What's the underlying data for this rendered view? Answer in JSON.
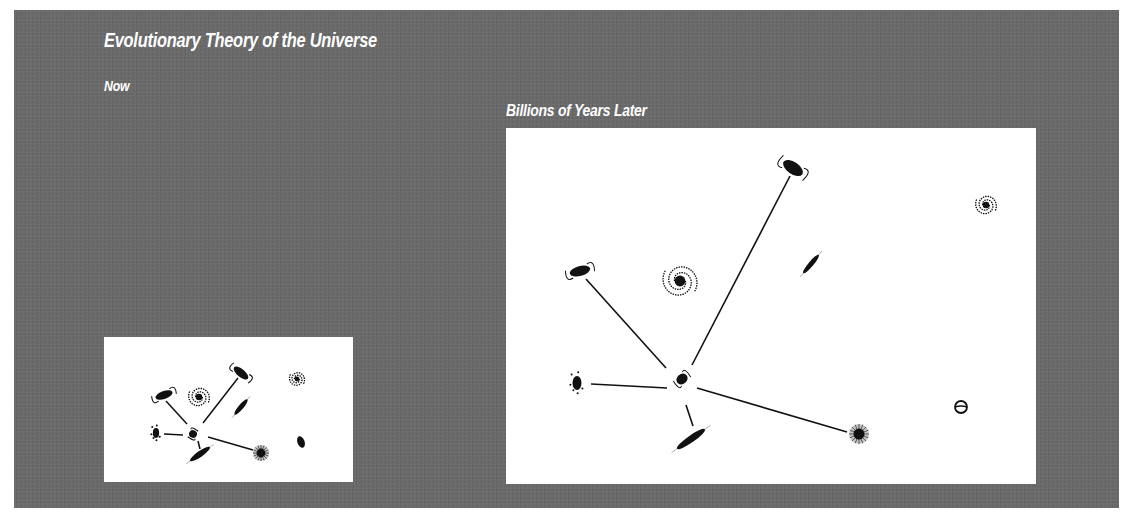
{
  "figure": {
    "title": "Evolutionary Theory of the Universe",
    "colors": {
      "background": "#6b6b6b",
      "panel": "#ffffff",
      "ink": "#111111",
      "text": "#ffffff"
    }
  },
  "panels": [
    {
      "id": "now",
      "label": "Now",
      "size": [
        249,
        145
      ],
      "center": [
        88,
        94
      ],
      "galaxies": [
        {
          "name": "elongated-spiral-top-left",
          "type": "barred",
          "x": 60,
          "y": 58,
          "rx": 12,
          "ry": 4,
          "rot": -20
        },
        {
          "name": "spiral-upper",
          "type": "spiral",
          "x": 95,
          "y": 60,
          "r": 11
        },
        {
          "name": "elongated-spiral-top",
          "type": "barred",
          "x": 137,
          "y": 36,
          "rx": 12,
          "ry": 4,
          "rot": 40
        },
        {
          "name": "spiral-top-right",
          "type": "spiral",
          "x": 193,
          "y": 42,
          "r": 8
        },
        {
          "name": "edge-on-middle",
          "type": "edgeon",
          "x": 137,
          "y": 70,
          "rx": 10,
          "ry": 2.5,
          "rot": -50
        },
        {
          "name": "irregular-left",
          "type": "irregular",
          "x": 52,
          "y": 96,
          "r": 7
        },
        {
          "name": "central-galaxy",
          "type": "barred",
          "x": 89,
          "y": 97,
          "rx": 5,
          "ry": 4,
          "rot": -60
        },
        {
          "name": "edge-on-bottom",
          "type": "edgeon",
          "x": 96,
          "y": 117,
          "rx": 12,
          "ry": 3,
          "rot": -35
        },
        {
          "name": "elliptical-bottom",
          "type": "elliptical",
          "x": 157,
          "y": 116,
          "r": 8
        },
        {
          "name": "irregular-right",
          "type": "compact",
          "x": 197,
          "y": 105,
          "r": 6
        }
      ],
      "lines": [
        {
          "from": [
            62,
            64
          ],
          "to": [
            83,
            87
          ]
        },
        {
          "from": [
            134,
            41
          ],
          "to": [
            99,
            86
          ]
        },
        {
          "from": [
            60,
            97
          ],
          "to": [
            79,
            98
          ]
        },
        {
          "from": [
            94,
            104
          ],
          "to": [
            96,
            112
          ]
        },
        {
          "from": [
            104,
            100
          ],
          "to": [
            149,
            113
          ]
        }
      ]
    },
    {
      "id": "later",
      "label": "Billions of Years Later",
      "size": [
        530,
        356
      ],
      "galaxies": [
        {
          "name": "elongated-spiral-left",
          "type": "barred",
          "x": 74,
          "y": 143,
          "rx": 14,
          "ry": 5,
          "rot": -15
        },
        {
          "name": "spiral-left",
          "type": "spiral",
          "x": 174,
          "y": 153,
          "r": 18
        },
        {
          "name": "elongated-spiral-top",
          "type": "barred",
          "x": 287,
          "y": 40,
          "rx": 15,
          "ry": 6,
          "rot": 35
        },
        {
          "name": "edge-on-middle",
          "type": "edgeon",
          "x": 305,
          "y": 136,
          "rx": 12,
          "ry": 2.5,
          "rot": -50
        },
        {
          "name": "spiral-top-right",
          "type": "spiral",
          "x": 480,
          "y": 77,
          "r": 11
        },
        {
          "name": "irregular-left",
          "type": "irregular",
          "x": 71,
          "y": 255,
          "r": 10
        },
        {
          "name": "central-galaxy",
          "type": "barred",
          "x": 176,
          "y": 251,
          "rx": 8,
          "ry": 5,
          "rot": -40
        },
        {
          "name": "edge-on-bottom",
          "type": "edgeon",
          "x": 185,
          "y": 311,
          "rx": 17,
          "ry": 3.5,
          "rot": -35
        },
        {
          "name": "elliptical-bottom-right",
          "type": "elliptical",
          "x": 353,
          "y": 306,
          "r": 10
        },
        {
          "name": "ring-galaxy-right",
          "type": "ring",
          "x": 455,
          "y": 279,
          "r": 6
        }
      ],
      "lines": [
        {
          "from": [
            80,
            151
          ],
          "to": [
            160,
            240
          ]
        },
        {
          "from": [
            284,
            48
          ],
          "to": [
            186,
            237
          ]
        },
        {
          "from": [
            85,
            256
          ],
          "to": [
            161,
            260
          ]
        },
        {
          "from": [
            180,
            277
          ],
          "to": [
            187,
            298
          ]
        },
        {
          "from": [
            191,
            260
          ],
          "to": [
            341,
            304
          ]
        }
      ]
    }
  ]
}
